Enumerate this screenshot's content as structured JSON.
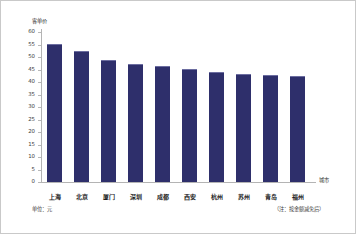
{
  "chart_data": {
    "type": "bar",
    "title": "",
    "xlabel": "城市",
    "ylabel": "客单价",
    "categories": [
      "上海",
      "北京",
      "厦门",
      "深圳",
      "成都",
      "西安",
      "杭州",
      "苏州",
      "青岛",
      "福州"
    ],
    "values": [
      55.0,
      52.0,
      48.3,
      47.0,
      46.0,
      45.0,
      43.8,
      43.0,
      42.5,
      42.0
    ],
    "ylim": [
      0,
      60
    ],
    "yticks": [
      0,
      5,
      10,
      15,
      20,
      25,
      30,
      35,
      40,
      45,
      50,
      55,
      60
    ],
    "ytick_labels": [
      "0",
      "5",
      "10",
      "15",
      "20",
      "25",
      "30",
      "35",
      "40",
      "45",
      "50",
      "55",
      "60"
    ],
    "grid": false,
    "legend": null,
    "bar_color": "#2e2f6b",
    "axis_color": "#b4b4b4",
    "annotations": {
      "unit_note": "单位：元",
      "source_note": "（注：按金额减免后）"
    }
  }
}
